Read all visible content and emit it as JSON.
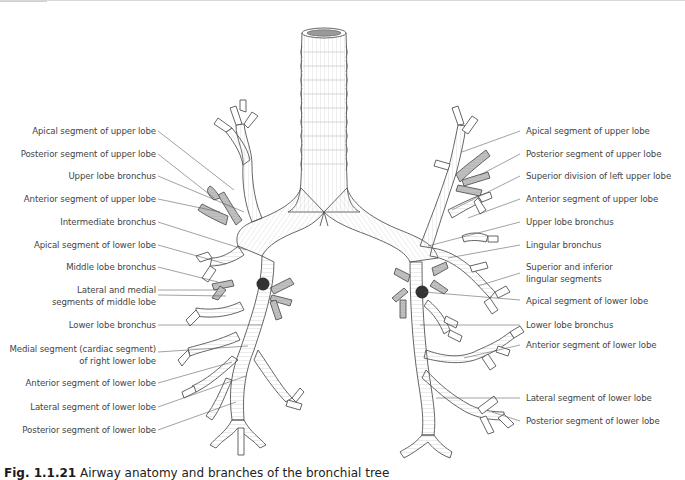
{
  "figure": {
    "title": "Airway anatomy and branches of the bronchial tree",
    "caption_number": "Fig. 1.1.21",
    "caption_text": "Airway anatomy and branches of the bronchial tree"
  },
  "colors": {
    "airway_fill": "#ffffff",
    "airway_stroke": "#555555",
    "ring_stroke": "#bdbdbd",
    "highlight_segment": "#bdbdbd",
    "node_marker": "#333333",
    "leader_line": "#555555",
    "label_text": "#444444"
  },
  "labels": {
    "right_lung": [
      {
        "id": "r-apical-upper",
        "text": "Apical segment of upper lobe"
      },
      {
        "id": "r-posterior-upper",
        "text": "Posterior segment of upper lobe"
      },
      {
        "id": "r-upper-lobe-bronchus",
        "text": "Upper lobe bronchus"
      },
      {
        "id": "r-anterior-upper",
        "text": "Anterior segment of upper lobe"
      },
      {
        "id": "r-intermediate-bronchus",
        "text": "Intermediate bronchus"
      },
      {
        "id": "r-apical-lower",
        "text": "Apical segment of lower lobe"
      },
      {
        "id": "r-middle-lobe-bronchus",
        "text": "Middle lobe bronchus"
      },
      {
        "id": "r-lateral-medial-middle-1",
        "text": "Lateral and medial"
      },
      {
        "id": "r-lateral-medial-middle-2",
        "text": "segments of middle lobe"
      },
      {
        "id": "r-lower-lobe-bronchus",
        "text": "Lower lobe bronchus"
      },
      {
        "id": "r-medial-cardiac-1",
        "text": "Medial segment (cardiac segment)"
      },
      {
        "id": "r-medial-cardiac-2",
        "text": "of right lower lobe"
      },
      {
        "id": "r-anterior-lower",
        "text": "Anterior segment of lower lobe"
      },
      {
        "id": "r-lateral-lower",
        "text": "Lateral segment of lower lobe"
      },
      {
        "id": "r-posterior-lower",
        "text": "Posterior segment of lower lobe"
      }
    ],
    "left_lung": [
      {
        "id": "l-apical-upper",
        "text": "Apical segment of upper lobe"
      },
      {
        "id": "l-posterior-upper",
        "text": "Posterior segment of upper lobe"
      },
      {
        "id": "l-superior-division",
        "text": "Superior division of left upper lobe"
      },
      {
        "id": "l-anterior-upper",
        "text": "Anterior segment of upper lobe"
      },
      {
        "id": "l-upper-lobe-bronchus",
        "text": "Upper lobe bronchus"
      },
      {
        "id": "l-lingular-bronchus",
        "text": "Lingular bronchus"
      },
      {
        "id": "l-sup-inf-lingular-1",
        "text": "Superior and inferior"
      },
      {
        "id": "l-sup-inf-lingular-2",
        "text": "lingular segments"
      },
      {
        "id": "l-apical-lower",
        "text": "Apical segment of lower lobe"
      },
      {
        "id": "l-lower-lobe-bronchus",
        "text": "Lower lobe bronchus"
      },
      {
        "id": "l-anterior-lower",
        "text": "Anterior segment of lower lobe"
      },
      {
        "id": "l-lateral-lower",
        "text": "Lateral segment of lower lobe"
      },
      {
        "id": "l-posterior-lower",
        "text": "Posterior segment of lower lobe"
      }
    ]
  }
}
